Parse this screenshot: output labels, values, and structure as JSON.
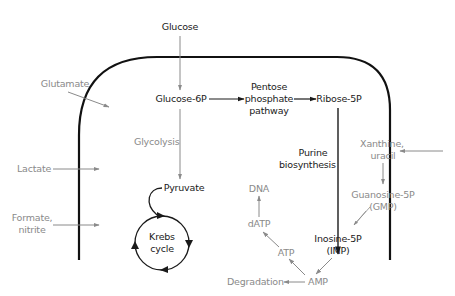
{
  "colors": {
    "dark": "#1a1a1a",
    "gray": "#8a8a8a",
    "membrane": "#111111"
  },
  "labels": {
    "glucose": "Glucose",
    "glucose6p": "Glucose-6P",
    "pentose1": "Pentose",
    "pentose2": "phosphate",
    "pentose3": "pathway",
    "ribose5p": "Ribose-5P",
    "glutamate": "Glutamate",
    "glycolysis": "Glycolysis",
    "purine1": "Purine",
    "purine2": "biosynthesis",
    "xanthine1": "Xanthine,",
    "xanthine2": "uracil",
    "lactate": "Lactate",
    "pyruvate": "Pyruvate",
    "dna": "DNA",
    "guanosine1": "Guanosine-5P",
    "guanosine2": "(GMP)",
    "formate1": "Formate,",
    "formate2": "nitrite",
    "krebs1": "Krebs",
    "krebs2": "cycle",
    "datp": "dATP",
    "inosine1": "Inosine-5P",
    "inosine2": "(IMP)",
    "atp": "ATP",
    "degradation": "Degradation",
    "amp": "AMP"
  }
}
